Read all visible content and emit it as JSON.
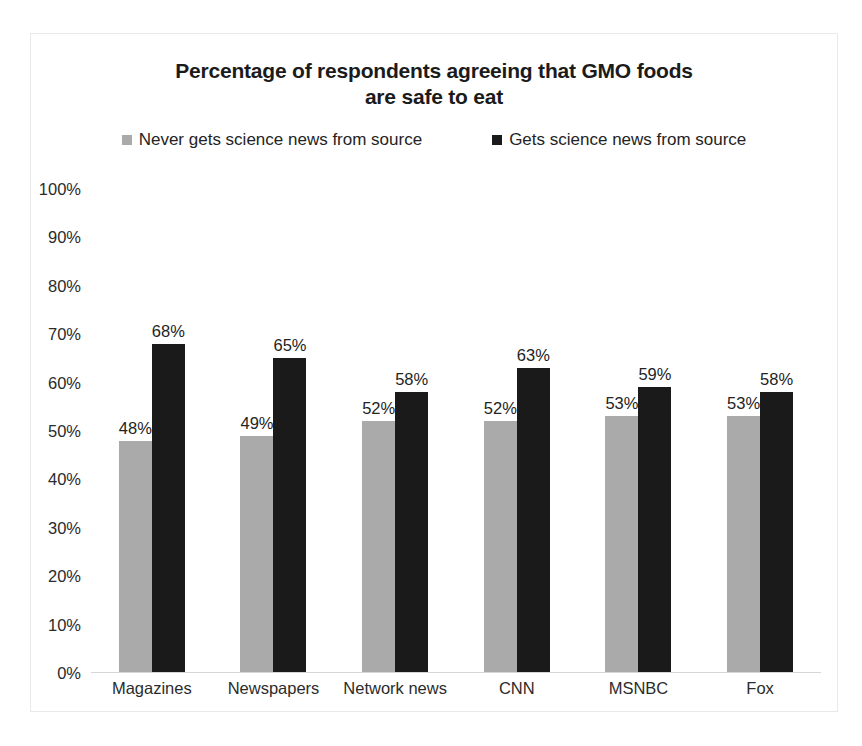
{
  "chart_data": {
    "type": "bar",
    "title": "Percentage of respondents agreeing that GMO foods are safe to eat",
    "title_line1": "Percentage of respondents agreeing that GMO foods",
    "title_line2": "are safe to eat",
    "xlabel": "",
    "ylabel": "",
    "ylim": [
      0,
      100
    ],
    "grid": false,
    "legend_position": "top-center",
    "categories": [
      "Magazines",
      "Newspapers",
      "Network news",
      "CNN",
      "MSNBC",
      "Fox"
    ],
    "y_ticks": [
      "0%",
      "10%",
      "20%",
      "30%",
      "40%",
      "50%",
      "60%",
      "70%",
      "80%",
      "90%",
      "100%"
    ],
    "y_tick_values": [
      0,
      10,
      20,
      30,
      40,
      50,
      60,
      70,
      80,
      90,
      100
    ],
    "series": [
      {
        "name": "Never gets science news from source",
        "color": "#aaaaaa",
        "values": [
          48,
          49,
          52,
          52,
          53,
          53
        ],
        "labels": [
          "48%",
          "49%",
          "52%",
          "52%",
          "53%",
          "53%"
        ]
      },
      {
        "name": "Gets science news from source",
        "color": "#1a1a1a",
        "values": [
          68,
          65,
          58,
          63,
          59,
          58
        ],
        "labels": [
          "68%",
          "65%",
          "58%",
          "63%",
          "59%",
          "58%"
        ]
      }
    ]
  },
  "legend": {
    "items": [
      {
        "label": "Never gets science news from source",
        "swatch": "#aaaaaa",
        "icon": "square-marker-icon"
      },
      {
        "label": "Gets science news from source",
        "swatch": "#1a1a1a",
        "icon": "square-marker-icon"
      }
    ]
  }
}
